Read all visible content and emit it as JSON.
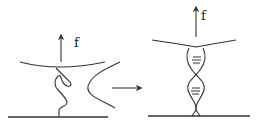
{
  "diagram": {
    "colors": {
      "stroke": "#333333",
      "background": "#ffffff"
    },
    "left_panel": {
      "force_label": "f",
      "state": "random-coil"
    },
    "transition_arrow": {
      "direction": "right"
    },
    "right_panel": {
      "force_label": "f",
      "state": "double-helix"
    }
  }
}
